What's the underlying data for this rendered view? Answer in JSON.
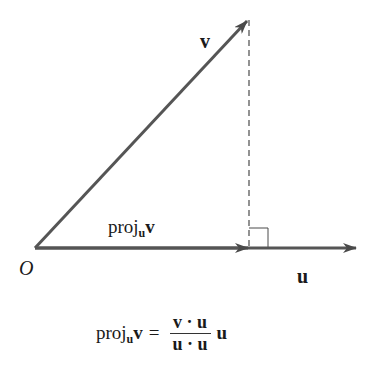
{
  "diagram": {
    "colors": {
      "vector": "#4a4a4a",
      "dashed": "#4a4a4a",
      "text": "#1a1a1a",
      "background": "#ffffff"
    },
    "labels": {
      "origin": "O",
      "v": "v",
      "u": "u",
      "proj_main": "proj",
      "proj_sub": "u",
      "proj_arg": "v"
    },
    "formula": {
      "lhs_main": "proj",
      "lhs_sub": "u",
      "lhs_arg": "v",
      "equals": "=",
      "numerator": "v · u",
      "denominator": "u · u",
      "trailing": "u"
    },
    "geometry": {
      "origin": [
        35,
        248
      ],
      "v_tip": [
        248,
        20
      ],
      "proj_tip": [
        248,
        248
      ],
      "u_tip": [
        356,
        248
      ],
      "right_angle_box": {
        "x": 249,
        "y": 228,
        "size": 19
      }
    }
  }
}
